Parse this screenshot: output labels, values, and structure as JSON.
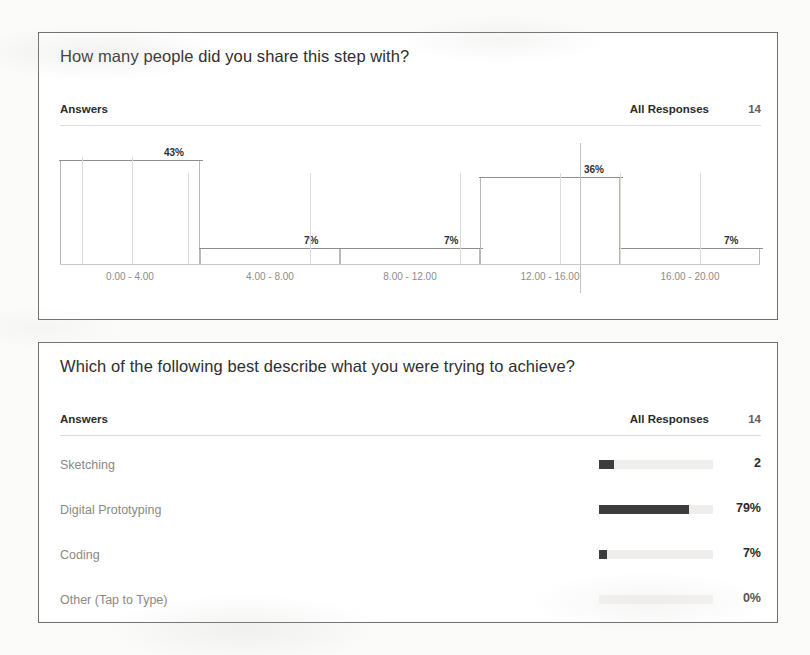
{
  "page": {
    "background": "#fbfbfa",
    "card_background": "#ffffff",
    "card_border": "#6f6f6f",
    "bar_color": "#3c3c3c",
    "track_color": "#efeeec"
  },
  "cards": [
    {
      "title": "How many people did you share this step with?",
      "answers_label": "Answers",
      "responses_label": "All Responses",
      "responses_count": "14"
    },
    {
      "title": "Which of the following best describe what you were trying to achieve?",
      "answers_label": "Answers",
      "responses_label": "All Responses",
      "responses_count": "14"
    }
  ],
  "chart_data": [
    {
      "type": "bar",
      "title": "How many people did you share this step with?",
      "xlabel": "",
      "ylabel": "",
      "ylim": [
        0,
        100
      ],
      "grid": false,
      "legend": null,
      "categories": [
        "0.00 - 4.00",
        "4.00 - 8.00",
        "8.00 - 12.00",
        "12.00 - 16.00",
        "16.00 - 20.00"
      ],
      "values": [
        43,
        7,
        7,
        36,
        7
      ],
      "data_labels": [
        "43%",
        "7%",
        "7%",
        "36%",
        "7%"
      ],
      "total_responses": 14
    },
    {
      "type": "bar",
      "title": "Which of the following best describe what you were trying to achieve?",
      "orientation": "horizontal",
      "xlabel": "",
      "ylabel": "",
      "xlim": [
        0,
        100
      ],
      "grid": false,
      "legend": null,
      "categories": [
        "Sketching",
        "Digital Prototyping",
        "Coding",
        "Other (Tap to Type)"
      ],
      "values": [
        14,
        79,
        7,
        0
      ],
      "data_labels": [
        "2",
        "79%",
        "7%",
        "0%"
      ],
      "total_responses": 14
    }
  ],
  "histogram": {
    "bins": [
      {
        "label": "0.00 - 4.00",
        "value_label": "43%",
        "pct": 43
      },
      {
        "label": "4.00 - 8.00",
        "value_label": "7%",
        "pct": 7
      },
      {
        "label": "8.00 - 12.00",
        "value_label": "7%",
        "pct": 7
      },
      {
        "label": "12.00 - 16.00",
        "value_label": "36%",
        "pct": 36
      },
      {
        "label": "16.00 - 20.00",
        "value_label": "7%",
        "pct": 7
      }
    ]
  },
  "choices": {
    "rows": [
      {
        "label": "Sketching",
        "value": "2",
        "fill_pct": 13
      },
      {
        "label": "Digital Prototyping",
        "value": "79%",
        "fill_pct": 79
      },
      {
        "label": "Coding",
        "value": "7%",
        "fill_pct": 7
      },
      {
        "label": "Other (Tap to Type)",
        "value": "0%",
        "fill_pct": 0
      }
    ]
  }
}
